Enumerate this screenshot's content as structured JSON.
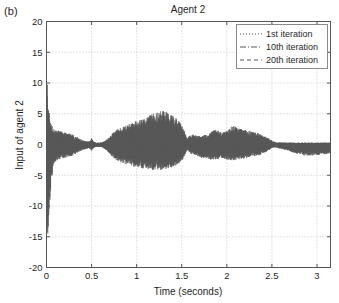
{
  "figure": {
    "panel_label": "(b)",
    "background_color": "#ffffff",
    "axis_color": "#555555",
    "grid_color": "#c8c8c8",
    "text_color": "#1f1f1f"
  },
  "chart_data": {
    "type": "line",
    "title": "Agent 2",
    "xlabel": "Time (seconds)",
    "ylabel": "Input of agent 2",
    "xlim": [
      0,
      3.15
    ],
    "ylim": [
      -20,
      20
    ],
    "xticks": [
      0,
      0.5,
      1,
      1.5,
      2,
      2.5,
      3
    ],
    "xticklabels": [
      "0",
      "0.5",
      "1",
      "1.5",
      "2",
      "2.5",
      "3"
    ],
    "yticks": [
      -20,
      -15,
      -10,
      -5,
      0,
      5,
      10,
      15,
      20
    ],
    "yticklabels": [
      "-20",
      "-15",
      "-10",
      "-5",
      "0",
      "5",
      "10",
      "15",
      "20"
    ],
    "grid": true,
    "grid_style": "dotted",
    "legend_position": "upper right",
    "legend": [
      {
        "name": "1st iteration",
        "style": "dotted",
        "color": "#575757"
      },
      {
        "name": "10th iteration",
        "style": "dashdot",
        "color": "#575757"
      },
      {
        "name": "20th iteration",
        "style": "dashed",
        "color": "#575757"
      }
    ],
    "signal_color": "#575757",
    "envelope": {
      "t": [
        0.0,
        0.004,
        0.008,
        0.012,
        0.016,
        0.02,
        0.026,
        0.032,
        0.04,
        0.048,
        0.056,
        0.064,
        0.072,
        0.08,
        0.09,
        0.1,
        0.115,
        0.13,
        0.15,
        0.175,
        0.2,
        0.225,
        0.25,
        0.275,
        0.3,
        0.325,
        0.35,
        0.375,
        0.4,
        0.425,
        0.45,
        0.47,
        0.485,
        0.495,
        0.5,
        0.505,
        0.515,
        0.53,
        0.55,
        0.575,
        0.6,
        0.625,
        0.65,
        0.675,
        0.7,
        0.73,
        0.76,
        0.79,
        0.82,
        0.85,
        0.88,
        0.91,
        0.94,
        0.97,
        1.0,
        1.03,
        1.06,
        1.09,
        1.12,
        1.15,
        1.18,
        1.21,
        1.24,
        1.26,
        1.28,
        1.3,
        1.32,
        1.34,
        1.36,
        1.38,
        1.4,
        1.42,
        1.44,
        1.46,
        1.48,
        1.5,
        1.52,
        1.535,
        1.55,
        1.56,
        1.575,
        1.59,
        1.61,
        1.63,
        1.66,
        1.69,
        1.72,
        1.75,
        1.78,
        1.81,
        1.84,
        1.87,
        1.9,
        1.93,
        1.96,
        1.99,
        2.02,
        2.05,
        2.08,
        2.11,
        2.14,
        2.17,
        2.2,
        2.23,
        2.26,
        2.29,
        2.32,
        2.35,
        2.38,
        2.41,
        2.44,
        2.465,
        2.485,
        2.5,
        2.515,
        2.535,
        2.555,
        2.575,
        2.6,
        2.625,
        2.65,
        2.675,
        2.7,
        2.73,
        2.76,
        2.79,
        2.82,
        2.85,
        2.88,
        2.91,
        2.94,
        2.97,
        3.0,
        3.03,
        3.06,
        3.09,
        3.12,
        3.15
      ],
      "upper": [
        12.2,
        11.6,
        10.4,
        9.3,
        8.1,
        7.0,
        6.0,
        5.2,
        4.4,
        3.8,
        3.3,
        3.0,
        2.8,
        2.6,
        2.5,
        2.4,
        2.3,
        2.3,
        2.2,
        2.1,
        2.0,
        1.9,
        1.8,
        1.7,
        1.5,
        1.3,
        1.1,
        0.9,
        0.7,
        0.6,
        0.5,
        0.5,
        0.6,
        0.8,
        1.0,
        0.9,
        0.6,
        0.4,
        0.3,
        0.3,
        0.3,
        0.4,
        0.6,
        0.9,
        1.3,
        1.8,
        2.2,
        2.5,
        2.7,
        2.9,
        3.1,
        3.3,
        3.5,
        3.7,
        3.9,
        4.0,
        4.2,
        4.4,
        4.6,
        4.8,
        5.0,
        5.2,
        5.3,
        5.4,
        5.5,
        5.5,
        5.4,
        5.2,
        5.1,
        5.0,
        4.8,
        4.6,
        4.3,
        4.0,
        3.6,
        3.2,
        2.6,
        2.0,
        1.4,
        1.0,
        1.2,
        1.5,
        1.7,
        1.6,
        1.5,
        1.4,
        1.4,
        1.5,
        1.6,
        1.8,
        2.2,
        2.4,
        2.3,
        2.1,
        2.0,
        2.2,
        2.6,
        2.9,
        3.0,
        2.8,
        2.6,
        2.5,
        2.4,
        2.3,
        2.2,
        2.1,
        2.0,
        1.8,
        1.6,
        1.4,
        1.2,
        1.0,
        0.8,
        0.7,
        0.5,
        0.4,
        0.3,
        0.3,
        0.3,
        0.3,
        0.3,
        0.3,
        0.3,
        0.3,
        0.3,
        0.3,
        0.3,
        0.3,
        0.3,
        0.3,
        0.3,
        0.3,
        0.3,
        0.3,
        0.3,
        0.3,
        0.3,
        0.3
      ],
      "lower": [
        -13.0,
        -14.5,
        -15.6,
        -16.0,
        -15.4,
        -14.2,
        -12.4,
        -10.6,
        -8.6,
        -7.0,
        -5.8,
        -4.8,
        -4.0,
        -3.4,
        -3.0,
        -2.8,
        -2.6,
        -2.5,
        -2.4,
        -2.3,
        -2.2,
        -2.1,
        -2.0,
        -1.9,
        -1.7,
        -1.5,
        -1.3,
        -1.1,
        -0.9,
        -0.8,
        -0.7,
        -0.6,
        -0.7,
        -0.9,
        -1.1,
        -1.0,
        -0.7,
        -0.5,
        -0.4,
        -0.4,
        -0.4,
        -0.5,
        -0.8,
        -1.1,
        -1.5,
        -2.0,
        -2.4,
        -2.7,
        -2.9,
        -3.1,
        -3.2,
        -3.4,
        -3.5,
        -3.6,
        -3.7,
        -3.8,
        -3.9,
        -4.0,
        -4.0,
        -4.1,
        -4.1,
        -4.2,
        -4.2,
        -4.2,
        -4.1,
        -4.1,
        -4.0,
        -4.0,
        -3.9,
        -3.8,
        -3.7,
        -3.6,
        -3.4,
        -3.2,
        -3.0,
        -2.7,
        -2.2,
        -1.7,
        -1.2,
        -0.9,
        -1.1,
        -1.4,
        -1.6,
        -1.7,
        -1.8,
        -2.0,
        -2.1,
        -2.2,
        -2.3,
        -2.4,
        -2.5,
        -2.5,
        -2.4,
        -2.3,
        -2.3,
        -2.4,
        -2.5,
        -2.6,
        -2.6,
        -2.5,
        -2.4,
        -2.4,
        -2.3,
        -2.2,
        -2.1,
        -2.0,
        -1.9,
        -1.8,
        -1.6,
        -1.4,
        -1.2,
        -1.0,
        -0.8,
        -0.6,
        -0.5,
        -0.5,
        -0.5,
        -0.6,
        -0.7,
        -0.8,
        -0.9,
        -1.0,
        -1.1,
        -1.3,
        -1.5,
        -1.6,
        -1.7,
        -1.8,
        -1.8,
        -1.8,
        -1.8,
        -1.8,
        -1.7,
        -1.7,
        -1.6,
        -1.6,
        -1.5,
        -1.4
      ]
    }
  }
}
